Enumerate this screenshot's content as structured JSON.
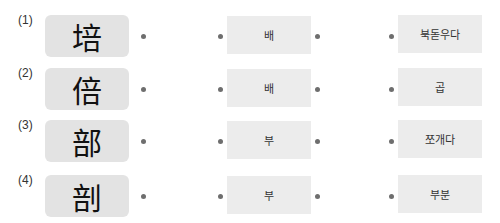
{
  "rows": [
    {
      "number": "(1)",
      "hanja": "培",
      "sound": "배",
      "meaning": "북돋우다"
    },
    {
      "number": "(2)",
      "hanja": "倍",
      "sound": "배",
      "meaning": "곱"
    },
    {
      "number": "(3)",
      "hanja": "部",
      "sound": "부",
      "meaning": "쪼개다"
    },
    {
      "number": "(4)",
      "hanja": "剖",
      "sound": "부",
      "meaning": "부분"
    }
  ],
  "colors": {
    "hanja_box_bg": "#e3e3e3",
    "text_box_bg": "#ececec",
    "dot": "#6e6e6e"
  }
}
